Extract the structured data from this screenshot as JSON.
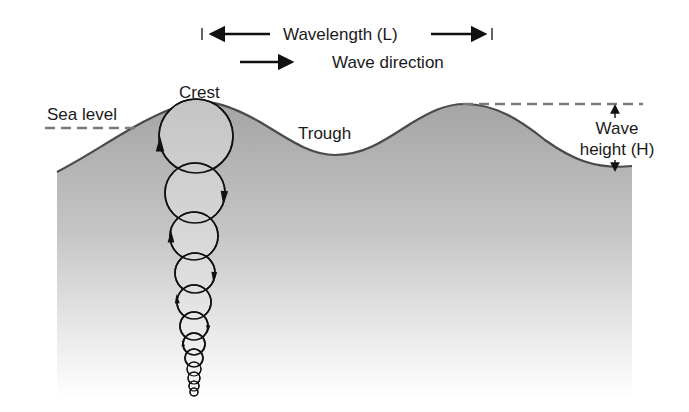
{
  "diagram": {
    "labels": {
      "wavelength": "Wavelength (L)",
      "wave_direction": "Wave direction",
      "crest": "Crest",
      "trough": "Trough",
      "sea_level": "Sea level",
      "wave_height_line1": "Wave",
      "wave_height_line2": "height (H)"
    },
    "colors": {
      "water_top": "#a4a4a4",
      "water_mid": "#c8c8c8",
      "water_bottom": "#ffffff",
      "outline": "#4a4a4a",
      "ink": "#111111",
      "dash": "#7a7a7a",
      "circle_fill": "#c9c9c9"
    },
    "surface_path": "M57,172 C100,150 140,118 185,104 C210,97 235,108 260,122 C290,140 310,155 335,155 C365,155 385,140 410,124 C430,112 445,104 465,104 C495,104 520,120 545,140 C570,158 595,170 632,166",
    "orbits": [
      {
        "cx": 196,
        "cy": 136,
        "r": 37
      },
      {
        "cx": 195,
        "cy": 193,
        "r": 30
      },
      {
        "cx": 194,
        "cy": 236,
        "r": 24
      },
      {
        "cx": 195,
        "cy": 273,
        "r": 20
      },
      {
        "cx": 194,
        "cy": 302,
        "r": 17
      },
      {
        "cx": 194,
        "cy": 326,
        "r": 14
      },
      {
        "cx": 194,
        "cy": 344,
        "r": 11
      },
      {
        "cx": 194,
        "cy": 358,
        "r": 9
      },
      {
        "cx": 194,
        "cy": 369,
        "r": 7
      },
      {
        "cx": 194,
        "cy": 378,
        "r": 6
      },
      {
        "cx": 194,
        "cy": 386,
        "r": 5
      },
      {
        "cx": 194,
        "cy": 392,
        "r": 4
      }
    ]
  }
}
